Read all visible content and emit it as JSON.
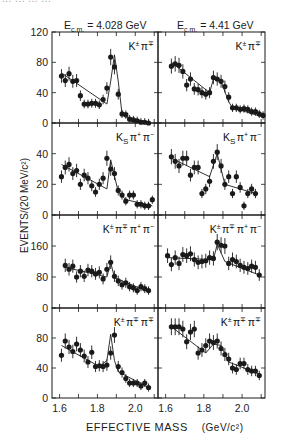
{
  "figure": {
    "cutoff_text": "... ... ... ...",
    "column_titles": [
      "E_c.m. = 4.028 GeV",
      "E_c.m. = 4.41 GeV"
    ],
    "column_title_parts": [
      {
        "prefix": "E",
        "sub": "c.m.",
        "suffix": " = 4.028 GeV"
      },
      {
        "prefix": "E",
        "sub": "c.m.",
        "suffix": " = 4.41 GeV"
      }
    ],
    "ylabel": "EVENTS/(20 MeV/c²)",
    "xlabel": "EFFECTIVE MASS",
    "xunit": "(GeV/c²)",
    "xtick_labels": [
      "1.6",
      "1.8",
      "2.0"
    ]
  },
  "chart_data": [
    {
      "type": "scatter",
      "panel": "row1-left",
      "title": "E_c.m. = 4.028 GeV",
      "channel": "K±π∓",
      "xlabel": "EFFECTIVE MASS (GeV/c²)",
      "ylabel": "EVENTS/(20 MeV/c²)",
      "xlim": [
        1.56,
        2.12
      ],
      "ylim": [
        0,
        120
      ],
      "yticks": [
        0,
        40,
        80,
        120
      ],
      "xticks": [
        1.6,
        1.8,
        2.0
      ],
      "x": [
        1.61,
        1.63,
        1.65,
        1.67,
        1.69,
        1.71,
        1.73,
        1.75,
        1.77,
        1.79,
        1.81,
        1.83,
        1.85,
        1.87,
        1.89,
        1.91,
        1.93,
        1.95,
        1.97,
        1.99,
        2.01,
        2.03,
        2.05,
        2.07
      ],
      "y": [
        62,
        56,
        65,
        55,
        56,
        36,
        25,
        25,
        26,
        26,
        24,
        31,
        46,
        87,
        74,
        38,
        12,
        11,
        5,
        4,
        3,
        1,
        1,
        0
      ],
      "fit": {
        "x": [
          1.61,
          1.85,
          1.87,
          1.89,
          1.91,
          1.93,
          1.95,
          2.07
        ],
        "y": [
          66,
          25,
          55,
          90,
          55,
          12,
          8,
          1
        ]
      }
    },
    {
      "type": "scatter",
      "panel": "row1-right",
      "title": "E_c.m. = 4.41 GeV",
      "channel": "K±π∓",
      "xlim": [
        1.56,
        2.12
      ],
      "ylim": [
        0,
        120
      ],
      "yticks": [
        0,
        40,
        80,
        120
      ],
      "xticks": [
        1.6,
        1.8,
        2.0
      ],
      "x": [
        1.63,
        1.65,
        1.67,
        1.69,
        1.71,
        1.73,
        1.75,
        1.77,
        1.79,
        1.81,
        1.83,
        1.85,
        1.87,
        1.89,
        1.91,
        1.93,
        1.95,
        1.97,
        1.99,
        2.01,
        2.03,
        2.05,
        2.07,
        2.09,
        2.11
      ],
      "y": [
        75,
        78,
        76,
        68,
        50,
        58,
        45,
        44,
        40,
        38,
        40,
        60,
        58,
        55,
        48,
        34,
        20,
        20,
        18,
        19,
        18,
        15,
        15,
        12,
        10
      ],
      "fit": {
        "x": [
          1.63,
          1.83,
          1.85,
          1.89,
          1.93,
          1.95,
          2.11
        ],
        "y": [
          80,
          40,
          58,
          55,
          28,
          20,
          8
        ]
      }
    },
    {
      "type": "scatter",
      "panel": "row2-left",
      "channel": "K_Sπ+π−",
      "xlim": [
        1.56,
        2.12
      ],
      "ylim": [
        0,
        60
      ],
      "yticks": [
        0,
        20,
        40
      ],
      "xticks": [
        1.6,
        1.8,
        2.0
      ],
      "x": [
        1.61,
        1.63,
        1.65,
        1.67,
        1.69,
        1.71,
        1.73,
        1.75,
        1.77,
        1.79,
        1.81,
        1.83,
        1.85,
        1.87,
        1.89,
        1.91,
        1.93,
        1.95,
        1.97,
        1.99,
        2.01,
        2.03,
        2.05,
        2.07,
        2.09
      ],
      "y": [
        25,
        31,
        33,
        27,
        29,
        20,
        26,
        24,
        19,
        15,
        20,
        24,
        37,
        30,
        27,
        16,
        13,
        9,
        13,
        13,
        7,
        7,
        6,
        6,
        10
      ],
      "fit": {
        "x": [
          1.61,
          1.85,
          1.87,
          1.91,
          1.95,
          2.09
        ],
        "y": [
          33,
          17,
          36,
          15,
          10,
          6
        ]
      }
    },
    {
      "type": "scatter",
      "panel": "row2-right",
      "channel": "K_Sπ+π−",
      "xlim": [
        1.56,
        2.12
      ],
      "ylim": [
        0,
        60
      ],
      "yticks": [
        0,
        20,
        40
      ],
      "xticks": [
        1.6,
        1.8,
        2.0
      ],
      "x": [
        1.63,
        1.65,
        1.67,
        1.69,
        1.71,
        1.73,
        1.75,
        1.77,
        1.79,
        1.81,
        1.83,
        1.85,
        1.87,
        1.89,
        1.91,
        1.93,
        1.95,
        1.97,
        1.99,
        2.01,
        2.03,
        2.05,
        2.07
      ],
      "y": [
        38,
        35,
        32,
        37,
        37,
        26,
        31,
        31,
        14,
        17,
        22,
        35,
        41,
        32,
        20,
        25,
        14,
        25,
        18,
        6,
        14,
        17,
        14
      ],
      "fit": {
        "x": [
          1.63,
          1.83,
          1.87,
          1.91,
          2.07
        ],
        "y": [
          37,
          25,
          40,
          20,
          14
        ]
      }
    },
    {
      "type": "scatter",
      "panel": "row3-left",
      "channel": "K±π∓π+π−",
      "xlim": [
        1.56,
        2.12
      ],
      "ylim": [
        0,
        240
      ],
      "yticks": [
        0,
        80,
        160
      ],
      "xticks": [
        1.6,
        1.8,
        2.0
      ],
      "x": [
        1.63,
        1.65,
        1.67,
        1.69,
        1.71,
        1.73,
        1.75,
        1.77,
        1.79,
        1.81,
        1.83,
        1.85,
        1.87,
        1.89,
        1.91,
        1.93,
        1.95,
        1.97,
        1.99,
        2.01,
        2.03,
        2.05,
        2.07
      ],
      "y": [
        110,
        100,
        108,
        80,
        95,
        82,
        98,
        95,
        88,
        92,
        75,
        100,
        118,
        82,
        70,
        60,
        65,
        55,
        52,
        45,
        55,
        50,
        45
      ],
      "fit": {
        "x": [
          1.63,
          1.85,
          1.87,
          1.89,
          2.07
        ],
        "y": [
          105,
          80,
          118,
          78,
          42
        ]
      }
    },
    {
      "type": "scatter",
      "panel": "row3-right",
      "channel": "K±π∓π+π−",
      "xlim": [
        1.56,
        2.12
      ],
      "ylim": [
        0,
        240
      ],
      "yticks": [
        0,
        80,
        160
      ],
      "xticks": [
        1.6,
        1.8,
        2.0
      ],
      "x": [
        1.61,
        1.63,
        1.65,
        1.67,
        1.69,
        1.71,
        1.73,
        1.75,
        1.77,
        1.79,
        1.81,
        1.83,
        1.85,
        1.87,
        1.89,
        1.91,
        1.93,
        1.95,
        1.97,
        1.99,
        2.01,
        2.03,
        2.05,
        2.07,
        2.09
      ],
      "y": [
        135,
        112,
        130,
        115,
        138,
        135,
        140,
        125,
        118,
        120,
        122,
        130,
        128,
        170,
        162,
        160,
        115,
        125,
        120,
        110,
        105,
        102,
        108,
        105,
        85
      ],
      "fit": {
        "x": [
          1.61,
          1.85,
          1.87,
          1.91,
          2.09
        ],
        "y": [
          130,
          125,
          165,
          120,
          85
        ]
      }
    },
    {
      "type": "scatter",
      "panel": "row4-left",
      "channel": "K±π∓π∓",
      "xlim": [
        1.56,
        2.12
      ],
      "ylim": [
        0,
        120
      ],
      "yticks": [
        0,
        40,
        80
      ],
      "xticks": [
        1.6,
        1.8,
        2.0
      ],
      "x": [
        1.61,
        1.63,
        1.65,
        1.67,
        1.69,
        1.71,
        1.73,
        1.75,
        1.77,
        1.79,
        1.81,
        1.83,
        1.85,
        1.87,
        1.89,
        1.91,
        1.93,
        1.95,
        1.97,
        1.99,
        2.01,
        2.03,
        2.05,
        2.07
      ],
      "y": [
        57,
        76,
        68,
        62,
        72,
        64,
        56,
        48,
        61,
        42,
        43,
        42,
        44,
        60,
        84,
        42,
        34,
        26,
        20,
        20,
        20,
        16,
        20,
        14
      ],
      "fit": {
        "x": [
          1.61,
          1.81,
          1.85,
          1.87,
          1.89,
          1.91,
          2.07
        ],
        "y": [
          70,
          42,
          50,
          85,
          50,
          35,
          14
        ]
      }
    },
    {
      "type": "scatter",
      "panel": "row4-right",
      "channel": "K±π∓π∓",
      "xlim": [
        1.56,
        2.12
      ],
      "ylim": [
        0,
        120
      ],
      "yticks": [
        0,
        40,
        80
      ],
      "xticks": [
        1.6,
        1.8,
        2.0
      ],
      "x": [
        1.63,
        1.65,
        1.67,
        1.69,
        1.71,
        1.73,
        1.75,
        1.77,
        1.79,
        1.81,
        1.83,
        1.85,
        1.87,
        1.89,
        1.91,
        1.93,
        1.95,
        1.97,
        1.99,
        2.01,
        2.03,
        2.05,
        2.07,
        2.09
      ],
      "y": [
        95,
        95,
        95,
        92,
        75,
        88,
        92,
        60,
        64,
        70,
        76,
        74,
        76,
        66,
        58,
        52,
        40,
        38,
        46,
        46,
        38,
        36,
        36,
        30
      ],
      "fit": {
        "x": [
          1.63,
          1.81,
          1.85,
          1.89,
          1.93,
          2.09
        ],
        "y": [
          95,
          60,
          72,
          70,
          48,
          32
        ]
      }
    }
  ],
  "panel_labels": [
    {
      "base": "K",
      "sup1": "±",
      "rest": [
        [
          "π",
          "∓"
        ]
      ]
    },
    {
      "base": "K",
      "sup1": "±",
      "rest": [
        [
          "π",
          "∓"
        ]
      ]
    },
    {
      "base": "K",
      "sub": "S",
      "rest": [
        [
          "π",
          "+"
        ],
        [
          "π",
          "−"
        ]
      ]
    },
    {
      "base": "K",
      "sub": "S",
      "rest": [
        [
          "π",
          "+"
        ],
        [
          "π",
          "−"
        ]
      ]
    },
    {
      "base": "K",
      "sup1": "±",
      "rest": [
        [
          "π",
          "∓"
        ],
        [
          "π",
          "+"
        ],
        [
          "π",
          "−"
        ]
      ]
    },
    {
      "base": "K",
      "sup1": "±",
      "rest": [
        [
          "π",
          "∓"
        ],
        [
          "π",
          "+"
        ],
        [
          "π",
          "−"
        ]
      ]
    },
    {
      "base": "K",
      "sup1": "±",
      "rest": [
        [
          "π",
          "∓"
        ],
        [
          "π",
          "∓"
        ]
      ]
    },
    {
      "base": "K",
      "sup1": "±",
      "rest": [
        [
          "π",
          "∓"
        ],
        [
          "π",
          "∓"
        ]
      ]
    }
  ]
}
